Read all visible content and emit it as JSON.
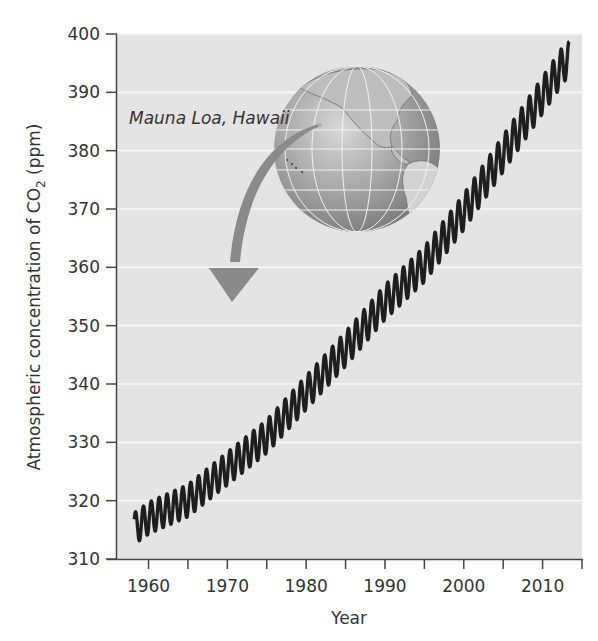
{
  "chart_data": {
    "type": "line",
    "title": "",
    "xlabel": "Year",
    "ylabel": "Atmospheric concentration of CO2 (ppm)",
    "ylabel_parts": {
      "prefix": "Atmospheric concentration of CO",
      "subscript": "2",
      "suffix": " (ppm)"
    },
    "xlim": [
      1956,
      2015
    ],
    "ylim": [
      310,
      400
    ],
    "x_ticks_labeled": [
      1960,
      1970,
      1980,
      1990,
      2000,
      2010
    ],
    "x_ticks_minor": [
      1965,
      1975,
      1985,
      1995,
      2005,
      2015
    ],
    "y_ticks": [
      310,
      320,
      330,
      340,
      350,
      360,
      370,
      380,
      390,
      400
    ],
    "grid": {
      "horizontal": true,
      "vertical": false
    },
    "legend": null,
    "annotation": {
      "text": "Mauna Loa, Hawaii",
      "type": "arrow-from-globe-location"
    },
    "series": [
      {
        "name": "Atmospheric CO2 (Keeling curve)",
        "seasonal_amplitude_ppm": 3.2,
        "x": [
          1958,
          1960,
          1965,
          1970,
          1975,
          1980,
          1985,
          1990,
          1995,
          2000,
          2005,
          2010,
          2013
        ],
        "values": [
          315.0,
          317.0,
          320.0,
          325.5,
          331.0,
          338.5,
          346.0,
          354.0,
          360.5,
          369.5,
          379.5,
          389.5,
          395.5
        ]
      }
    ]
  },
  "style": {
    "plot_bg": "#e4e4e4",
    "grid_color": "#f7f7f7",
    "axis_color": "#444444",
    "line_color": "#1e1e1e",
    "arrow_color": "#8a8a8a",
    "globe_ocean": "#9a9a9a",
    "globe_land": "#c8c8c8"
  }
}
